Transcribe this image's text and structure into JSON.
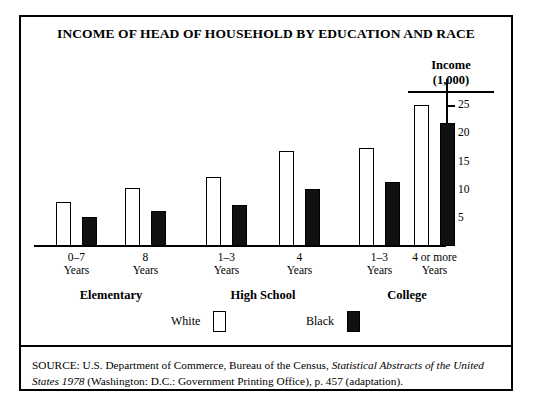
{
  "chart_data": {
    "type": "bar",
    "title": "INCOME OF HEAD OF HOUSEHOLD BY EDUCATION AND RACE",
    "ylabel_line1": "Income",
    "ylabel_line2": "(1,000)",
    "xlabel": "",
    "ylim": [
      0,
      27
    ],
    "yticks": [
      5,
      10,
      15,
      20,
      25
    ],
    "ytick_labels": [
      "5",
      "10",
      "15",
      "20",
      "25"
    ],
    "grid": false,
    "legend_position": "bottom",
    "categories": [
      "0–7 Years",
      "8 Years",
      "1–3 Years",
      "4 Years",
      "1–3 Years",
      "4 or more Years"
    ],
    "category_lines": [
      [
        "0–7",
        "Years"
      ],
      [
        "8",
        "Years"
      ],
      [
        "1–3",
        "Years"
      ],
      [
        "4",
        "Years"
      ],
      [
        "1–3",
        "Years"
      ],
      [
        "4 or more",
        "Years"
      ]
    ],
    "groups": [
      {
        "label": "Elementary",
        "categories": [
          "0–7 Years",
          "8 Years"
        ]
      },
      {
        "label": "High School",
        "categories": [
          "1–3 Years",
          "4 Years"
        ]
      },
      {
        "label": "College",
        "categories": [
          "1–3 Years",
          "4 or more Years"
        ]
      }
    ],
    "series": [
      {
        "name": "White",
        "color": "#ffffff",
        "values": [
          7.8,
          10.3,
          12.3,
          16.8,
          17.4,
          25.0
        ]
      },
      {
        "name": "Black",
        "color": "#111111",
        "values": [
          5.2,
          6.3,
          7.2,
          10.2,
          11.3,
          21.8
        ]
      }
    ]
  },
  "legend": {
    "entries": [
      {
        "label": "White",
        "style": "white"
      },
      {
        "label": "Black",
        "style": "black"
      }
    ]
  },
  "source": {
    "prefix": "SOURCE:  U.S. Department of Commerce, Bureau of the Census, ",
    "italic1": "Statistical Abstracts of the United States",
    "italic2": "1978",
    "suffix": " (Washington: D.C.: Government Printing Office), p. 457 (adaptation)."
  }
}
